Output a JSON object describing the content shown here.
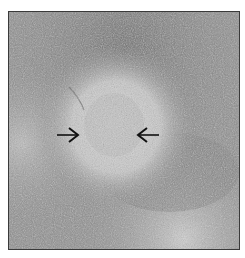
{
  "figure": {
    "type": "grayscale histology micrograph",
    "border_color": "#3a3a3a",
    "background_tone": "#8e8e8e",
    "annotations": [
      {
        "glyph": "arrow-right",
        "position": "left of central lesion"
      },
      {
        "glyph": "arrow-left",
        "position": "right of central lesion"
      }
    ]
  }
}
